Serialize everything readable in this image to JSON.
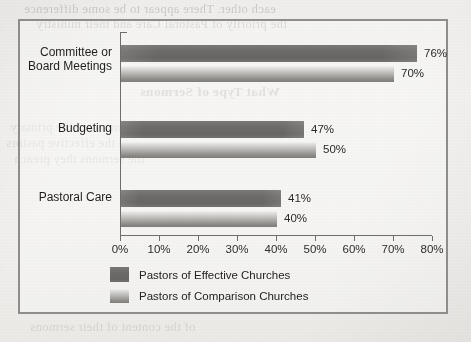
{
  "page": {
    "background_color": "#f2f1ef",
    "bleed_through_lines": [
      "each other. There appear to be some difference",
      "the priority of Pastoral Care and their ministry",
      "What Type of Sermons",
      "Sermons are the primary",
      "and the effective pastors",
      "the sermons they preach"
    ],
    "bleed_footer": "of the content of their sermons"
  },
  "chart_data": {
    "type": "bar",
    "orientation": "horizontal",
    "title": "",
    "xlabel": "",
    "ylabel": "",
    "categories": [
      "Committee or\nBoard Meetings",
      "Budgeting",
      "Pastoral Care"
    ],
    "series": [
      {
        "name": "Pastors of Effective Churches",
        "color": "#6d6c6a",
        "values": [
          76,
          70,
          47
        ],
        "value_labels": [
          "76%",
          "47%",
          "41%"
        ]
      },
      {
        "name": "Pastors of Comparison Churches",
        "color": "#b4b3b0",
        "values": [
          70,
          50,
          40
        ],
        "value_labels": [
          "70%",
          "50%",
          "40%"
        ]
      }
    ],
    "groups": [
      {
        "category": "Committee or\nBoard Meetings",
        "effective": 76,
        "effective_label": "76%",
        "comparison": 70,
        "comparison_label": "70%"
      },
      {
        "category": "Budgeting",
        "effective": 47,
        "effective_label": "47%",
        "comparison": 50,
        "comparison_label": "50%"
      },
      {
        "category": "Pastoral Care",
        "effective": 41,
        "effective_label": "41%",
        "comparison": 40,
        "comparison_label": "40%"
      }
    ],
    "xlim": [
      0,
      80
    ],
    "xticks": [
      0,
      10,
      20,
      30,
      40,
      50,
      60,
      70,
      80
    ],
    "xtick_labels": [
      "0%",
      "10%",
      "20%",
      "30%",
      "40%",
      "50%",
      "60%",
      "70%",
      "80%"
    ],
    "grid": false,
    "legend_position": "bottom",
    "legend": [
      "Pastors of Effective Churches",
      "Pastors of Comparison Churches"
    ]
  }
}
